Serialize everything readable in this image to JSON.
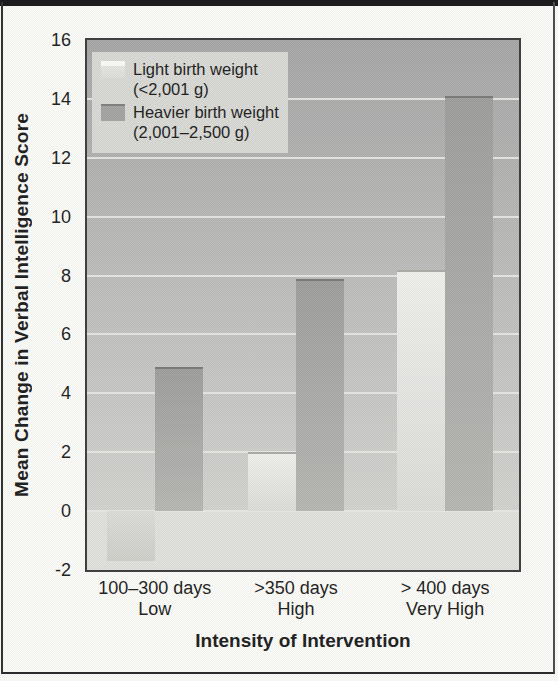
{
  "figure": {
    "y_axis_title": "Mean Change in Verbal Intelligence Score",
    "x_axis_title": "Intensity of Intervention",
    "y_ticks": [
      "16",
      "14",
      "12",
      "10",
      "8",
      "6",
      "4",
      "2",
      "0",
      "-2"
    ],
    "legend": [
      {
        "series": "light",
        "line1": "Light birth weight",
        "line2": "(<2,001 g)"
      },
      {
        "series": "heavy",
        "line1": "Heavier birth weight",
        "line2": "(2,001–2,500 g)"
      }
    ],
    "x_categories": [
      {
        "line1": "100–300 days",
        "line2": "Low"
      },
      {
        "line1": ">350 days",
        "line2": "High"
      },
      {
        "line1": "> 400 days",
        "line2": "Very High"
      }
    ]
  },
  "chart_data": {
    "type": "bar",
    "title": "",
    "categories": [
      "100–300 days (Low)",
      ">350 days (High)",
      "> 400 days (Very High)"
    ],
    "series": [
      {
        "name": "Light birth weight (<2,001 g)",
        "values": [
          -1.7,
          2.0,
          8.2
        ]
      },
      {
        "name": "Heavier birth weight (2,001–2,500 g)",
        "values": [
          4.9,
          7.9,
          14.1
        ]
      }
    ],
    "xlabel": "Intensity of Intervention",
    "ylabel": "Mean Change in Verbal Intelligence Score",
    "ylim": [
      -2,
      16
    ],
    "ytick_step": 2,
    "grid": true,
    "legend_position": "top-left"
  },
  "colors": {
    "page_bg": "#fbfbf8",
    "text": "#1b1b1b",
    "plot_bg_top": "#a6a6a6",
    "plot_bg_bottom": "#d2d2cf",
    "below_zero_bg": "#e0e0dd",
    "gridline": "#e8e8e4",
    "legend_bg": "#d8d8d4",
    "light_bar_top": "#efefec",
    "light_bar_bottom": "#dcdcd8",
    "heavy_bar_top": "#9e9e9c",
    "heavy_bar_bottom": "#b6b6b3"
  }
}
